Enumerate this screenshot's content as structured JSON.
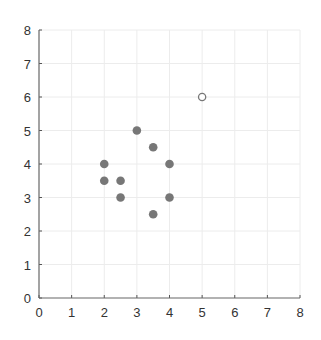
{
  "chart_data": {
    "type": "scatter",
    "title": "",
    "xlabel": "",
    "ylabel": "",
    "xlim": [
      0,
      8
    ],
    "ylim": [
      0,
      8
    ],
    "x_ticks": [
      "0",
      "1",
      "2",
      "3",
      "4",
      "5",
      "6",
      "7",
      "8"
    ],
    "y_ticks": [
      "0",
      "1",
      "2",
      "3",
      "4",
      "5",
      "6",
      "7",
      "8"
    ],
    "grid": true,
    "legend": null,
    "series": [
      {
        "name": "filled",
        "style": "filled",
        "color": "#777777",
        "points": [
          [
            2,
            4
          ],
          [
            2,
            3.5
          ],
          [
            2.5,
            3.5
          ],
          [
            2.5,
            3
          ],
          [
            3,
            5
          ],
          [
            3.5,
            4.5
          ],
          [
            4,
            4
          ],
          [
            4,
            3
          ],
          [
            3.5,
            2.5
          ]
        ]
      },
      {
        "name": "hollow",
        "style": "hollow",
        "color": "#777777",
        "points": [
          [
            5,
            6
          ]
        ]
      }
    ]
  }
}
